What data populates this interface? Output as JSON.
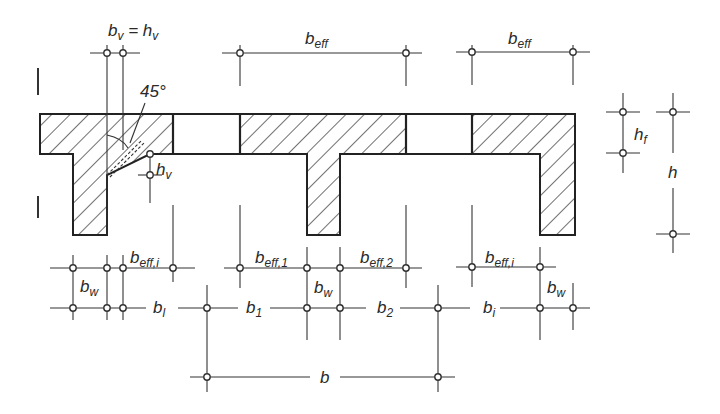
{
  "diagram": {
    "labels": {
      "bv_eq_hv": "b",
      "bv_sub": "v",
      "bv_eq": " = h",
      "hv_sub": "v",
      "angle": "45°",
      "beff_top1": "b",
      "beff_top1_sub": "eff",
      "beff_top2": "b",
      "beff_top2_sub": "eff",
      "hf": "h",
      "hf_sub": "f",
      "h": "h",
      "hv": "h",
      "hv2_sub": "v",
      "beff_i_left": "b",
      "beff_i_left_sub": "eff,i",
      "beff_1": "b",
      "beff_1_sub": "eff,1",
      "beff_2": "b",
      "beff_2_sub": "eff,2",
      "beff_i_right": "b",
      "beff_i_right_sub": "eff,i",
      "bw_left": "b",
      "bw_left_sub": "w",
      "bw_mid": "b",
      "bw_mid_sub": "w",
      "bw_right": "b",
      "bw_right_sub": "w",
      "bl": "b",
      "bl_sub": "l",
      "b1": "b",
      "b1_sub": "1",
      "b2": "b",
      "b2_sub": "2",
      "bi": "b",
      "bi_sub": "i",
      "b": "b"
    }
  }
}
